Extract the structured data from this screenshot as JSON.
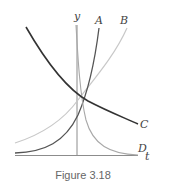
{
  "figure": {
    "caption": "Figure 3.18",
    "axes": {
      "vertical_label": "y",
      "horizontal_label": "t"
    },
    "curves": [
      {
        "id": "A",
        "label": "A",
        "description": "steep exponential growth",
        "color": "#555555"
      },
      {
        "id": "B",
        "label": "B",
        "description": "slower exponential growth",
        "color": "#c8c8c8"
      },
      {
        "id": "C",
        "label": "C",
        "description": "gradual exponential decay",
        "color": "#333333"
      },
      {
        "id": "D",
        "label": "D",
        "description": "rapid exponential decay",
        "color": "#a8a8a8"
      }
    ],
    "colors": {
      "axis": "#888888",
      "label": "#444444",
      "caption": "#666666"
    }
  }
}
